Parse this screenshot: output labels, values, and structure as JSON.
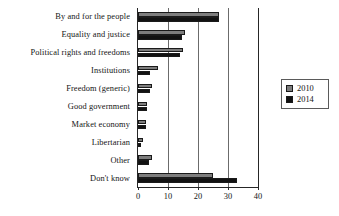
{
  "chart_data": {
    "type": "bar",
    "orientation": "horizontal",
    "title": "",
    "xlabel": "",
    "ylabel": "",
    "xlim": [
      0,
      40
    ],
    "xticks": [
      0,
      10,
      20,
      30,
      40
    ],
    "xtick_labels": [
      "0",
      "10",
      "20",
      "30",
      "40"
    ],
    "grid": true,
    "grid_axis": "x",
    "legend_position": "right",
    "categories": [
      "By and for the people",
      "Equality and justice",
      "Political rights and freedoms",
      "Institutions",
      "Freedom (generic)",
      "Good government",
      "Market economy",
      "Libertarian",
      "Other",
      "Don't know"
    ],
    "series": [
      {
        "name": "2010",
        "color": "#7d7d7d",
        "values": [
          27,
          15.5,
          15,
          6.5,
          4.5,
          3,
          2.5,
          1.5,
          4.5,
          25
        ]
      },
      {
        "name": "2014",
        "color": "#121212",
        "values": [
          27,
          14.5,
          14,
          4,
          4,
          3,
          2.5,
          1,
          3.5,
          33
        ]
      }
    ]
  },
  "legend": {
    "entries": [
      {
        "label": "2010"
      },
      {
        "label": "2014"
      }
    ]
  }
}
